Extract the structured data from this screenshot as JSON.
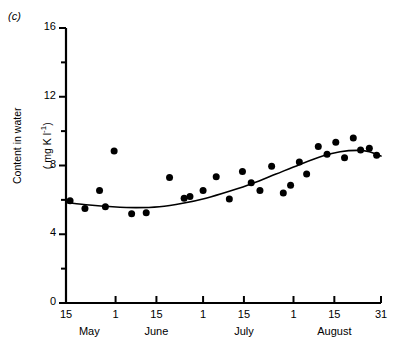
{
  "panel": {
    "letter": "(c)"
  },
  "chart_data": {
    "type": "scatter",
    "title": "",
    "xlabel": "",
    "ylabel": "Content in water ( mg K l⁻¹)",
    "ylabel_line1": "Content in water",
    "ylabel_line2_pre": "( mg K l",
    "ylabel_line2_sup": "-1",
    "ylabel_line2_post": ")",
    "ylim": [
      0,
      16
    ],
    "xlim_days": [
      0,
      108
    ],
    "grid": false,
    "legend": null,
    "y_ticks_major": [
      0,
      4,
      8,
      12,
      16
    ],
    "y_ticks_minor": [
      2,
      6,
      10,
      14
    ],
    "y_tick_labels": [
      "0",
      "4",
      "8",
      "12",
      "16"
    ],
    "x_ticks_days": [
      0,
      17,
      31,
      47,
      61,
      78,
      92,
      108
    ],
    "x_tick_labels": [
      "15",
      "1",
      "15",
      "1",
      "15",
      "1",
      "15",
      "31"
    ],
    "x_months": [
      {
        "label": "May",
        "day": 8
      },
      {
        "label": "June",
        "day": 31
      },
      {
        "label": "July",
        "day": 61
      },
      {
        "label": "August",
        "day": 92
      }
    ],
    "marker": {
      "shape": "circle",
      "color": "#000000",
      "size_px": 7
    },
    "line": {
      "type": "smoothed-trend",
      "color": "#000000",
      "width_px": 1.6
    },
    "x": [
      1.4,
      6.5,
      11.5,
      13.5,
      16.5,
      22.5,
      27.5,
      35.5,
      40.5,
      42.5,
      47.0,
      51.5,
      56.0,
      60.5,
      63.5,
      66.5,
      70.5,
      74.5,
      77.0,
      80.0,
      82.5,
      86.5,
      89.5,
      92.5,
      95.5,
      98.5,
      101.0,
      104.0,
      106.5
    ],
    "y": [
      5.95,
      5.5,
      6.55,
      5.6,
      8.85,
      5.2,
      5.25,
      7.3,
      6.1,
      6.2,
      6.55,
      7.35,
      6.05,
      7.65,
      7.0,
      6.55,
      7.95,
      6.4,
      6.85,
      8.2,
      7.5,
      9.1,
      8.65,
      9.35,
      8.45,
      9.6,
      8.9,
      9.0,
      8.6
    ],
    "trend_points": [
      {
        "x": 0.0,
        "y": 5.85
      },
      {
        "x": 8.0,
        "y": 5.7
      },
      {
        "x": 16.0,
        "y": 5.6
      },
      {
        "x": 24.0,
        "y": 5.55
      },
      {
        "x": 32.0,
        "y": 5.6
      },
      {
        "x": 40.0,
        "y": 5.8
      },
      {
        "x": 48.0,
        "y": 6.1
      },
      {
        "x": 56.0,
        "y": 6.5
      },
      {
        "x": 64.0,
        "y": 6.95
      },
      {
        "x": 72.0,
        "y": 7.5
      },
      {
        "x": 80.0,
        "y": 8.05
      },
      {
        "x": 88.0,
        "y": 8.55
      },
      {
        "x": 94.0,
        "y": 8.8
      },
      {
        "x": 100.0,
        "y": 8.88
      },
      {
        "x": 104.0,
        "y": 8.8
      },
      {
        "x": 108.0,
        "y": 8.55
      }
    ]
  }
}
